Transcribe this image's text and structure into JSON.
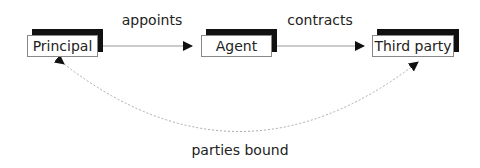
{
  "diagram": {
    "nodes": [
      {
        "id": "principal",
        "label": "Principal"
      },
      {
        "id": "agent",
        "label": "Agent"
      },
      {
        "id": "third_party",
        "label": "Third party"
      }
    ],
    "edges": [
      {
        "from": "principal",
        "to": "agent",
        "label": "appoints",
        "style": "solid"
      },
      {
        "from": "agent",
        "to": "third_party",
        "label": "contracts",
        "style": "solid"
      },
      {
        "from": "third_party",
        "to": "principal",
        "label": "parties bound",
        "style": "dashed",
        "bidirectional": true
      }
    ]
  }
}
